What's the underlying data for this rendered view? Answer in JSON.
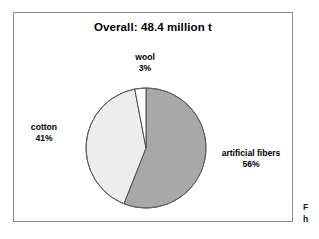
{
  "figure": {
    "background_color": "#ffffff",
    "frame_border_color": "#8c8c8c"
  },
  "chart_data": {
    "type": "pie",
    "title": "Overall: 48.4 million t",
    "subtitle": "",
    "xlabel": "",
    "ylabel": "",
    "total_label": "48.4 million t",
    "total_value": 48.4,
    "unit": "million t",
    "legend_position": "none",
    "labels_outside": true,
    "start_angle_deg": 0,
    "direction": "clockwise",
    "categories": [
      "artificial fibers",
      "cotton",
      "wool"
    ],
    "values": [
      56,
      41,
      3
    ],
    "value_labels": [
      "56%",
      "41%",
      "3%"
    ],
    "colors": [
      "#a8a8a8",
      "#ededed",
      "#ffffff"
    ],
    "slice_edge_color": "#4d4d4d",
    "slices": [
      {
        "name": "artificial fibers",
        "value": 56,
        "value_label": "56%",
        "color": "#a8a8a8",
        "label_position": "right"
      },
      {
        "name": "cotton",
        "value": 41,
        "value_label": "41%",
        "color": "#ededed",
        "label_position": "left"
      },
      {
        "name": "wool",
        "value": 3,
        "value_label": "3%",
        "color": "#ffffff",
        "label_position": "top"
      }
    ]
  },
  "edge_caption": {
    "line1": "F",
    "line2": "h"
  }
}
